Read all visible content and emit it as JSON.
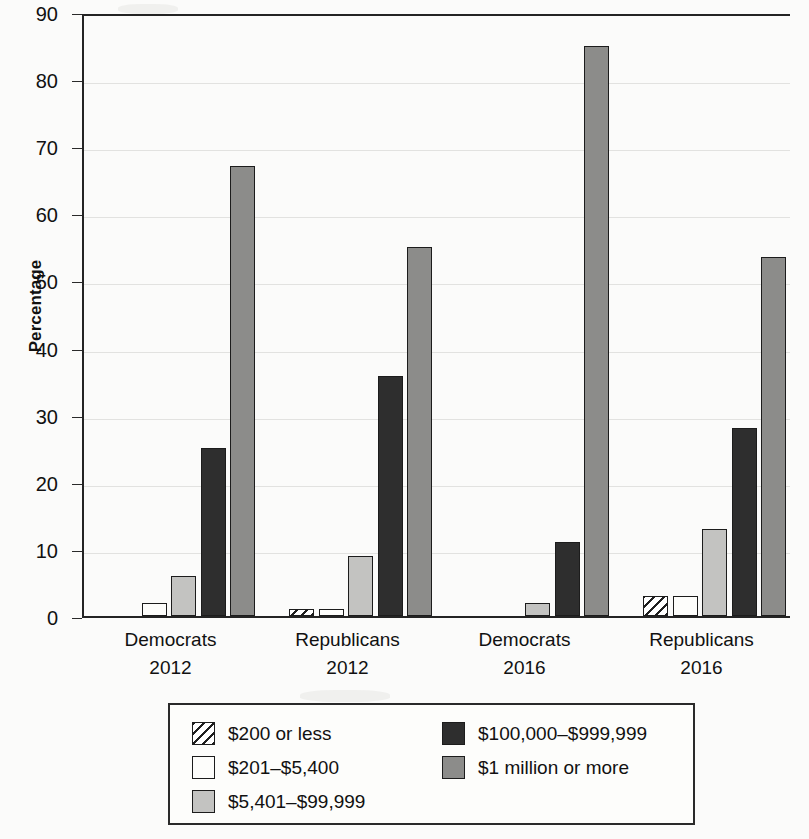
{
  "chart_data": {
    "type": "bar",
    "title": "",
    "xlabel": "",
    "ylabel": "Percentage",
    "ylim": [
      0,
      90
    ],
    "ytick_step": 10,
    "yticks": [
      "90",
      "80",
      "70",
      "60",
      "50",
      "40",
      "30",
      "20",
      "10",
      "0"
    ],
    "grid": true,
    "grid_axis": "y",
    "legend_position": "bottom",
    "categories": [
      "Democrats 2012",
      "Republicans 2012",
      "Democrats 2016",
      "Republicans 2016"
    ],
    "category_lines": [
      {
        "line1": "Democrats",
        "line2": "2012"
      },
      {
        "line1": "Republicans",
        "line2": "2012"
      },
      {
        "line1": "Democrats",
        "line2": "2016"
      },
      {
        "line1": "Republicans",
        "line2": "2016"
      }
    ],
    "series": [
      {
        "name": "$200 or less",
        "fill": "hatch",
        "color": "#ffffff",
        "values": [
          0,
          1,
          0,
          3
        ]
      },
      {
        "name": "$201–$5,400",
        "fill": "white",
        "color": "#fdfdfb",
        "values": [
          2,
          1,
          0,
          3
        ]
      },
      {
        "name": "$5,401–$99,999",
        "fill": "lightgray",
        "color": "#c3c3c1",
        "values": [
          6,
          9,
          2,
          13
        ]
      },
      {
        "name": "$100,000–$999,999",
        "fill": "dark",
        "color": "#2e2e2e",
        "values": [
          25,
          35.8,
          11,
          28
        ]
      },
      {
        "name": "$1 million or more",
        "fill": "midgray",
        "color": "#8c8c8a",
        "values": [
          67,
          55,
          85,
          53.5
        ]
      }
    ]
  },
  "legend": {
    "column1": [
      "$200 or less",
      "$201–$5,400",
      "$5,401–$99,999"
    ],
    "column2": [
      "$100,000–$999,999",
      "$1 million or more"
    ]
  }
}
